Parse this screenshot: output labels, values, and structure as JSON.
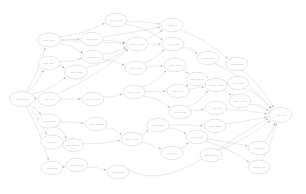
{
  "diagram": {
    "type": "directed-acyclic-graph",
    "layout": "left-to-right",
    "background_color": "#ffffff",
    "node_fill": "#ffffff",
    "node_stroke": "#c4c4cc",
    "edge_color": "#c9c9cf",
    "arrow_color": "#9a9aa2",
    "label_color": "#b9b9c2"
  },
  "chart_data": {
    "type": "diagram",
    "node_count": 40,
    "edge_count": 63
  },
  "nodes": [
    {
      "id": "n0",
      "label": "start_pipeline",
      "cx": 22,
      "cy": 99,
      "rx": 12.5,
      "ry": 7.5
    },
    {
      "id": "n1",
      "label": "load_config",
      "cx": 49,
      "cy": 40,
      "rx": 11.5,
      "ry": 7.0
    },
    {
      "id": "n2",
      "label": "read_input",
      "cx": 49,
      "cy": 63,
      "rx": 11.0,
      "ry": 6.8
    },
    {
      "id": "n3",
      "label": "fetch_source",
      "cx": 49,
      "cy": 121,
      "rx": 11.5,
      "ry": 7.0
    },
    {
      "id": "n4",
      "label": "scan_files",
      "cx": 52,
      "cy": 142,
      "rx": 11.0,
      "ry": 6.8
    },
    {
      "id": "n5",
      "label": "list_assets",
      "cx": 52,
      "cy": 168,
      "rx": 11.0,
      "ry": 6.8
    },
    {
      "id": "n6",
      "label": "init_env",
      "cx": 49,
      "cy": 99,
      "rx": 11.0,
      "ry": 6.8
    },
    {
      "id": "n7",
      "label": "parse_args",
      "cx": 76,
      "cy": 72,
      "rx": 11.5,
      "ry": 7.0
    },
    {
      "id": "n8",
      "label": "verify_hash",
      "cx": 92,
      "cy": 39,
      "rx": 11.0,
      "ry": 6.8
    },
    {
      "id": "n9",
      "label": "build_index",
      "cx": 93,
      "cy": 57,
      "rx": 10.5,
      "ry": 6.6
    },
    {
      "id": "n10",
      "label": "prep_batch",
      "cx": 116,
      "cy": 20,
      "rx": 11.0,
      "ry": 6.8
    },
    {
      "id": "n11",
      "label": "resolve_deps",
      "cx": 93,
      "cy": 99,
      "rx": 11.0,
      "ry": 6.8
    },
    {
      "id": "n12",
      "label": "open_stream",
      "cx": 96,
      "cy": 124,
      "rx": 11.0,
      "ry": 6.8
    },
    {
      "id": "n13",
      "label": "map_schema",
      "cx": 73,
      "cy": 145,
      "rx": 10.5,
      "ry": 6.6
    },
    {
      "id": "n14",
      "label": "decode_blob",
      "cx": 77,
      "cy": 165,
      "rx": 11.0,
      "ry": 6.8
    },
    {
      "id": "n15",
      "label": "join_tables",
      "cx": 118,
      "cy": 172,
      "rx": 11.0,
      "ry": 6.8
    },
    {
      "id": "n16",
      "label": "merge_nodes",
      "cx": 137,
      "cy": 44,
      "rx": 11.0,
      "ry": 6.8
    },
    {
      "id": "n17",
      "label": "filter_rows",
      "cx": 136,
      "cy": 68,
      "rx": 11.0,
      "ry": 6.8
    },
    {
      "id": "n18",
      "label": "group_keys",
      "cx": 134,
      "cy": 92,
      "rx": 11.0,
      "ry": 6.8
    },
    {
      "id": "n19",
      "label": "apply_rules",
      "cx": 132,
      "cy": 139,
      "rx": 11.0,
      "ry": 6.8
    },
    {
      "id": "n20",
      "label": "calc_metrics",
      "cx": 158,
      "cy": 125,
      "rx": 11.0,
      "ry": 6.8
    },
    {
      "id": "n21",
      "label": "reduce_set",
      "cx": 172,
      "cy": 153,
      "rx": 11.0,
      "ry": 6.8
    },
    {
      "id": "n22",
      "label": "validate_io",
      "cx": 172,
      "cy": 25,
      "rx": 11.0,
      "ry": 6.8
    },
    {
      "id": "n23",
      "label": "emit_event",
      "cx": 173,
      "cy": 44,
      "rx": 11.0,
      "ry": 6.8
    },
    {
      "id": "n24",
      "label": "route_msg",
      "cx": 175,
      "cy": 65,
      "rx": 11.0,
      "ry": 6.8
    },
    {
      "id": "n25",
      "label": "queue_job",
      "cx": 178,
      "cy": 91,
      "rx": 11.0,
      "ry": 6.8
    },
    {
      "id": "n26",
      "label": "sync_cache",
      "cx": 180,
      "cy": 112,
      "rx": 11.0,
      "ry": 6.8
    },
    {
      "id": "n27",
      "label": "hash_chunk",
      "cx": 197,
      "cy": 79,
      "rx": 11.0,
      "ry": 6.8
    },
    {
      "id": "n28",
      "label": "track_state",
      "cx": 197,
      "cy": 137,
      "rx": 11.0,
      "ry": 6.8
    },
    {
      "id": "n29",
      "label": "compress_out",
      "cx": 211,
      "cy": 155,
      "rx": 11.0,
      "ry": 6.8
    },
    {
      "id": "n30",
      "label": "encode_frame",
      "cx": 216,
      "cy": 85,
      "rx": 11.0,
      "ry": 6.8
    },
    {
      "id": "n31",
      "label": "audit_log",
      "cx": 216,
      "cy": 108,
      "rx": 11.0,
      "ry": 6.8
    },
    {
      "id": "n32",
      "label": "write_shard",
      "cx": 215,
      "cy": 126,
      "rx": 11.0,
      "ry": 6.8
    },
    {
      "id": "n33",
      "label": "flush_buffer",
      "cx": 237,
      "cy": 64,
      "rx": 11.0,
      "ry": 6.8
    },
    {
      "id": "n34",
      "label": "seal_block",
      "cx": 238,
      "cy": 83,
      "rx": 10.5,
      "ry": 6.6
    },
    {
      "id": "n35",
      "label": "notify_hook",
      "cx": 240,
      "cy": 101,
      "rx": 11.0,
      "ry": 6.8
    },
    {
      "id": "n36",
      "label": "report_stat",
      "cx": 259,
      "cy": 148,
      "rx": 11.0,
      "ry": 6.8
    },
    {
      "id": "n37",
      "label": "archive_run",
      "cx": 259,
      "cy": 167,
      "rx": 11.0,
      "ry": 6.8
    },
    {
      "id": "n38",
      "label": "cleanup_tmp",
      "cx": 208,
      "cy": 58,
      "rx": 11.0,
      "ry": 6.8
    },
    {
      "id": "n39",
      "label": "finish_all",
      "cx": 280,
      "cy": 115,
      "rx": 12.0,
      "ry": 7.5
    }
  ],
  "edges": [
    {
      "from": "n0",
      "to": "n1",
      "label": "1"
    },
    {
      "from": "n0",
      "to": "n2",
      "label": "1"
    },
    {
      "from": "n0",
      "to": "n6",
      "label": "1"
    },
    {
      "from": "n0",
      "to": "n3",
      "label": "1"
    },
    {
      "from": "n0",
      "to": "n4",
      "label": "1"
    },
    {
      "from": "n0",
      "to": "n5",
      "label": "1"
    },
    {
      "from": "n0",
      "to": "n7",
      "label": "1"
    },
    {
      "from": "n1",
      "to": "n8",
      "label": "1"
    },
    {
      "from": "n1",
      "to": "n9",
      "label": "1"
    },
    {
      "from": "n1",
      "to": "n10",
      "label": "1"
    },
    {
      "from": "n1",
      "to": "n16",
      "label": "1"
    },
    {
      "from": "n2",
      "to": "n7",
      "label": "1"
    },
    {
      "from": "n2",
      "to": "n9",
      "label": "1"
    },
    {
      "from": "n6",
      "to": "n11",
      "label": "1"
    },
    {
      "from": "n6",
      "to": "n16",
      "label": "1"
    },
    {
      "from": "n7",
      "to": "n16",
      "label": "1"
    },
    {
      "from": "n8",
      "to": "n16",
      "label": "1"
    },
    {
      "from": "n8",
      "to": "n22",
      "label": "1"
    },
    {
      "from": "n9",
      "to": "n16",
      "label": "1"
    },
    {
      "from": "n10",
      "to": "n22",
      "label": "1"
    },
    {
      "from": "n10",
      "to": "n23",
      "label": "1"
    },
    {
      "from": "n11",
      "to": "n18",
      "label": "1"
    },
    {
      "from": "n3",
      "to": "n12",
      "label": "1"
    },
    {
      "from": "n3",
      "to": "n13",
      "label": "1"
    },
    {
      "from": "n4",
      "to": "n13",
      "label": "1"
    },
    {
      "from": "n5",
      "to": "n14",
      "label": "1"
    },
    {
      "from": "n12",
      "to": "n19",
      "label": "1"
    },
    {
      "from": "n13",
      "to": "n19",
      "label": "1"
    },
    {
      "from": "n14",
      "to": "n15",
      "label": "1"
    },
    {
      "from": "n16",
      "to": "n22",
      "label": "1"
    },
    {
      "from": "n16",
      "to": "n23",
      "label": "1"
    },
    {
      "from": "n17",
      "to": "n23",
      "label": "1"
    },
    {
      "from": "n17",
      "to": "n24",
      "label": "1"
    },
    {
      "from": "n18",
      "to": "n24",
      "label": "1"
    },
    {
      "from": "n18",
      "to": "n25",
      "label": "1"
    },
    {
      "from": "n18",
      "to": "n26",
      "label": "1"
    },
    {
      "from": "n19",
      "to": "n20",
      "label": "1"
    },
    {
      "from": "n19",
      "to": "n21",
      "label": "1"
    },
    {
      "from": "n20",
      "to": "n28",
      "label": "1"
    },
    {
      "from": "n21",
      "to": "n28",
      "label": "1"
    },
    {
      "from": "n22",
      "to": "n33",
      "label": "1"
    },
    {
      "from": "n23",
      "to": "n38",
      "label": "1"
    },
    {
      "from": "n24",
      "to": "n27",
      "label": "1"
    },
    {
      "from": "n25",
      "to": "n27",
      "label": "1"
    },
    {
      "from": "n25",
      "to": "n30",
      "label": "1"
    },
    {
      "from": "n26",
      "to": "n30",
      "label": "1"
    },
    {
      "from": "n26",
      "to": "n31",
      "label": "1"
    },
    {
      "from": "n27",
      "to": "n34",
      "label": "1"
    },
    {
      "from": "n28",
      "to": "n36",
      "label": "1"
    },
    {
      "from": "n28",
      "to": "n37",
      "label": "1"
    },
    {
      "from": "n29",
      "to": "n39",
      "label": "1"
    },
    {
      "from": "n30",
      "to": "n35",
      "label": "1"
    },
    {
      "from": "n31",
      "to": "n39",
      "label": "1"
    },
    {
      "from": "n32",
      "to": "n39",
      "label": "1"
    },
    {
      "from": "n33",
      "to": "n39",
      "label": "1"
    },
    {
      "from": "n34",
      "to": "n39",
      "label": "1"
    },
    {
      "from": "n35",
      "to": "n39",
      "label": "1"
    },
    {
      "from": "n36",
      "to": "n39",
      "label": "1"
    },
    {
      "from": "n37",
      "to": "n39",
      "label": "1"
    },
    {
      "from": "n38",
      "to": "n39",
      "label": "1"
    },
    {
      "from": "n15",
      "to": "n39",
      "label": "1"
    },
    {
      "from": "n9",
      "to": "n17",
      "label": "1"
    },
    {
      "from": "n20",
      "to": "n32",
      "label": "1"
    }
  ]
}
